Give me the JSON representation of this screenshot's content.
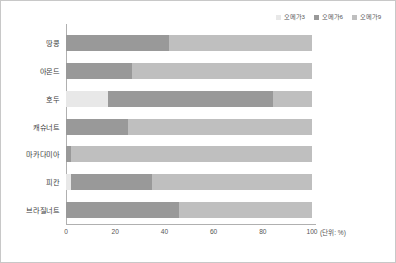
{
  "chart_data": {
    "type": "bar",
    "orientation": "horizontal",
    "stacked": true,
    "title": "",
    "subtitle": "",
    "xlabel": "",
    "ylabel": "",
    "unit_label": "(단위: %)",
    "xlim": [
      0,
      100
    ],
    "xticks": [
      0,
      20,
      40,
      60,
      80,
      100
    ],
    "xtick_labels": [
      "0",
      "20",
      "40",
      "60",
      "80",
      "100"
    ],
    "grid": false,
    "legend_position": "top-right",
    "categories": [
      "땅콩",
      "아몬드",
      "호두",
      "캐슈너트",
      "마카다미아",
      "피칸",
      "브라질너트"
    ],
    "series": [
      {
        "name": "오메가3",
        "color": "#e8e8e8",
        "values": [
          0,
          0,
          17,
          0,
          0,
          2,
          0
        ]
      },
      {
        "name": "오메가6",
        "color": "#999999",
        "values": [
          42,
          27,
          67,
          25,
          2,
          33,
          46
        ]
      },
      {
        "name": "오메가9",
        "color": "#bfbfbf",
        "values": [
          58,
          73,
          16,
          75,
          98,
          65,
          54
        ]
      }
    ]
  },
  "colors": {
    "omega3": "#e8e8e8",
    "omega6": "#999999",
    "omega9": "#bfbfbf",
    "axis": "#b0b0b0",
    "text": "#555555",
    "category_text": "#3d3d3d",
    "border": "#c8c8c8",
    "background": "#ffffff"
  }
}
